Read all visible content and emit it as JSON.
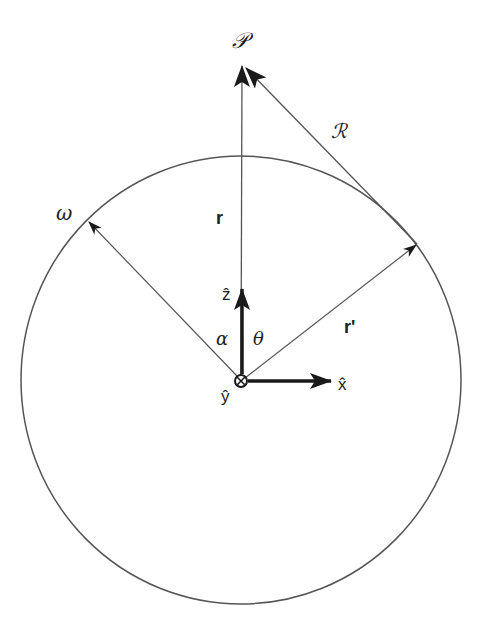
{
  "diagram": {
    "colors": {
      "line": "#555555",
      "arrow": "#1a1a1a",
      "background": "#ffffff"
    },
    "circle": {
      "cx": 241,
      "cy": 380,
      "rx": 220,
      "ry": 224,
      "label": "ω"
    },
    "origin": {
      "x": 241,
      "y": 381,
      "label": "ŷ",
      "symbol": "⊗"
    },
    "labels": {
      "field_point": "𝒫",
      "separation": "ℛ",
      "r": "r",
      "r_prime": "r'",
      "omega": "ω",
      "alpha": "α",
      "theta": "θ",
      "z_hat": "ẑ",
      "x_hat": "x̂",
      "y_hat": "ŷ"
    },
    "vectors": [
      {
        "name": "r",
        "from": [
          241,
          381
        ],
        "to": [
          242,
          65
        ]
      },
      {
        "name": "r_prime",
        "from": [
          241,
          381
        ],
        "to": [
          417,
          244
        ]
      },
      {
        "name": "R",
        "from": [
          417,
          244
        ],
        "to": [
          244,
          67
        ]
      },
      {
        "name": "omega_radius",
        "from": [
          241,
          381
        ],
        "to": [
          88,
          221
        ]
      },
      {
        "name": "z_hat",
        "from": [
          241,
          381
        ],
        "to": [
          242,
          289
        ]
      },
      {
        "name": "x_hat",
        "from": [
          241,
          381
        ],
        "to": [
          331,
          381
        ]
      }
    ]
  }
}
